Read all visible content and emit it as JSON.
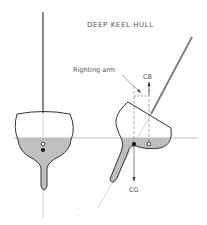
{
  "title": "DEEP KEEL HULL",
  "labels": {
    "righting_arm": "Righting arm",
    "cb": "CB",
    "cg": "CG"
  },
  "colors": {
    "line": "#333333",
    "fill_submerged": "#c8c8c8",
    "guide": "#aaaaaa",
    "background": "#ffffff"
  },
  "figures": [
    {
      "name": "upright-hull",
      "state": "upright"
    },
    {
      "name": "heeled-hull",
      "state": "heeled"
    }
  ]
}
